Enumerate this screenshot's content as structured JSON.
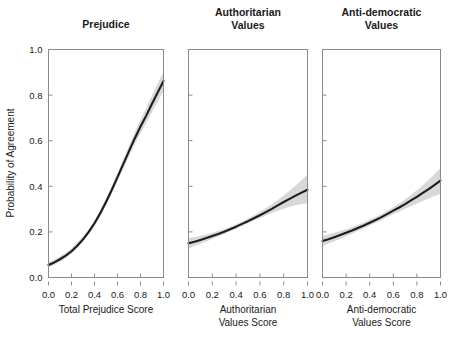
{
  "figure": {
    "background": "#ffffff",
    "line_color": "#1c1c1c",
    "band_color": "#d6d6d6",
    "axis_color": "#8a8a8a",
    "shared_ylabel": "Probability of Agreement"
  },
  "chart_data": {
    "type": "line",
    "title": "",
    "ylabel": "Probability of Agreement",
    "xlabel": "",
    "grid": false,
    "legend": "none",
    "ylim": [
      0.0,
      1.0
    ],
    "xlim": [
      0.0,
      1.0
    ],
    "ytick_labels": [
      "0.0",
      "0.2",
      "0.4",
      "0.6",
      "0.8",
      "1.0"
    ],
    "ytick_values": [
      0.0,
      0.2,
      0.4,
      0.6,
      0.8,
      1.0
    ],
    "xtick_labels": [
      "0.0",
      "0.2",
      "0.4",
      "0.6",
      "0.8",
      "1.0"
    ],
    "xtick_values": [
      0.0,
      0.2,
      0.4,
      0.6,
      0.8,
      1.0
    ],
    "panels": [
      {
        "title": "Prejudice",
        "title_lines": [
          "Prejudice"
        ],
        "xlabel": "Total Prejudice Score",
        "xlabel_lines": [
          "Total Prejudice Score"
        ],
        "x": [
          0.0,
          0.05,
          0.1,
          0.15,
          0.2,
          0.25,
          0.3,
          0.35,
          0.4,
          0.45,
          0.5,
          0.55,
          0.6,
          0.65,
          0.7,
          0.75,
          0.8,
          0.85,
          0.9,
          0.95,
          1.0
        ],
        "y": [
          0.055,
          0.066,
          0.08,
          0.096,
          0.115,
          0.139,
          0.167,
          0.2,
          0.238,
          0.282,
          0.331,
          0.384,
          0.44,
          0.497,
          0.554,
          0.61,
          0.662,
          0.71,
          0.762,
          0.812,
          0.862
        ],
        "ci_lower": [
          0.044,
          0.055,
          0.069,
          0.085,
          0.104,
          0.128,
          0.156,
          0.189,
          0.226,
          0.269,
          0.317,
          0.368,
          0.422,
          0.477,
          0.531,
          0.584,
          0.633,
          0.678,
          0.726,
          0.772,
          0.818
        ],
        "ci_upper": [
          0.068,
          0.079,
          0.093,
          0.109,
          0.128,
          0.152,
          0.18,
          0.213,
          0.251,
          0.296,
          0.346,
          0.401,
          0.459,
          0.518,
          0.578,
          0.637,
          0.692,
          0.743,
          0.798,
          0.851,
          0.903
        ]
      },
      {
        "title": "Authoritarian Values",
        "title_lines": [
          "Authoritarian",
          "Values"
        ],
        "xlabel": "Authoritarian Values Score",
        "xlabel_lines": [
          "Authoritarian",
          "Values Score"
        ],
        "x": [
          0.0,
          0.05,
          0.1,
          0.15,
          0.2,
          0.25,
          0.3,
          0.35,
          0.4,
          0.45,
          0.5,
          0.55,
          0.6,
          0.65,
          0.7,
          0.75,
          0.8,
          0.85,
          0.9,
          0.95,
          1.0
        ],
        "y": [
          0.15,
          0.157,
          0.165,
          0.173,
          0.182,
          0.191,
          0.201,
          0.212,
          0.223,
          0.235,
          0.247,
          0.26,
          0.273,
          0.287,
          0.301,
          0.316,
          0.331,
          0.345,
          0.359,
          0.372,
          0.385
        ],
        "ci_lower": [
          0.128,
          0.138,
          0.148,
          0.158,
          0.169,
          0.18,
          0.191,
          0.203,
          0.214,
          0.226,
          0.238,
          0.25,
          0.261,
          0.272,
          0.283,
          0.293,
          0.302,
          0.31,
          0.317,
          0.322,
          0.326
        ],
        "ci_upper": [
          0.173,
          0.177,
          0.183,
          0.189,
          0.196,
          0.204,
          0.213,
          0.223,
          0.234,
          0.246,
          0.259,
          0.273,
          0.288,
          0.304,
          0.321,
          0.34,
          0.36,
          0.382,
          0.404,
          0.427,
          0.452
        ]
      },
      {
        "title": "Anti-democratic Values",
        "title_lines": [
          "Anti-democratic",
          "Values"
        ],
        "xlabel": "Anti-democratic Values Score",
        "xlabel_lines": [
          "Anti-democratic",
          "Values Score"
        ],
        "x": [
          0.0,
          0.05,
          0.1,
          0.15,
          0.2,
          0.25,
          0.3,
          0.35,
          0.4,
          0.45,
          0.5,
          0.55,
          0.6,
          0.65,
          0.7,
          0.75,
          0.8,
          0.85,
          0.9,
          0.95,
          1.0
        ],
        "y": [
          0.16,
          0.168,
          0.177,
          0.186,
          0.196,
          0.206,
          0.217,
          0.228,
          0.24,
          0.252,
          0.265,
          0.279,
          0.293,
          0.307,
          0.322,
          0.338,
          0.354,
          0.371,
          0.388,
          0.406,
          0.425
        ],
        "ci_lower": [
          0.138,
          0.148,
          0.159,
          0.17,
          0.181,
          0.192,
          0.204,
          0.216,
          0.228,
          0.24,
          0.252,
          0.265,
          0.277,
          0.289,
          0.301,
          0.313,
          0.325,
          0.336,
          0.347,
          0.357,
          0.367
        ],
        "ci_upper": [
          0.183,
          0.189,
          0.196,
          0.204,
          0.212,
          0.221,
          0.231,
          0.242,
          0.253,
          0.265,
          0.278,
          0.293,
          0.308,
          0.325,
          0.343,
          0.362,
          0.383,
          0.405,
          0.429,
          0.454,
          0.481
        ]
      }
    ]
  }
}
